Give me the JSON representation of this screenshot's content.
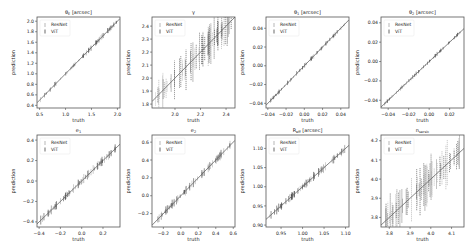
{
  "figure": {
    "legend": [
      "ResNet",
      "ViT"
    ],
    "colors": {
      "resnet": "#9a9a9a",
      "vit": "#2a2a2a",
      "diagonal": "#666666",
      "frame": "#555555"
    }
  },
  "chart_data": [
    {
      "type": "scatter",
      "title": "θE [arcsec]",
      "xlabel": "truth",
      "ylabel": "prediction",
      "xlim": [
        0.45,
        2.05
      ],
      "ylim": [
        0.35,
        2.08
      ],
      "xticks": [
        0.5,
        1.0,
        1.5,
        2.0
      ],
      "xticklabels": [
        "0.5",
        "1.0",
        "1.5",
        "2.0"
      ],
      "yticks": [
        0.4,
        0.6,
        0.8,
        1.0,
        1.2,
        1.4,
        1.6,
        1.8,
        2.0
      ],
      "yticklabels": [
        "0.4",
        "0.6",
        "0.8",
        "1.0",
        "1.2",
        "1.4",
        "1.6",
        "1.8",
        "2.0"
      ],
      "spread": 0.03,
      "legend": [
        "ResNet",
        "ViT"
      ],
      "legend_position": "upper left"
    },
    {
      "type": "scatter",
      "title": "γ",
      "xlabel": "truth",
      "ylabel": "prediction",
      "xlim": [
        1.82,
        2.47
      ],
      "ylim": [
        1.77,
        2.47
      ],
      "xticks": [
        2.0,
        2.2,
        2.4
      ],
      "xticklabels": [
        "2.0",
        "2.2",
        "2.4"
      ],
      "yticks": [
        1.8,
        1.9,
        2.0,
        2.1,
        2.2,
        2.3,
        2.4
      ],
      "yticklabels": [
        "1.8",
        "1.9",
        "2.0",
        "2.1",
        "2.2",
        "2.3",
        "2.4"
      ],
      "spread": 0.12,
      "legend": [
        "ResNet",
        "ViT"
      ],
      "legend_position": "upper left"
    },
    {
      "type": "scatter",
      "title": "θ1 [arcsec]",
      "xlabel": "truth",
      "ylabel": "prediction",
      "xlim": [
        -0.042,
        0.049
      ],
      "ylim": [
        -0.045,
        0.052
      ],
      "xticks": [
        -0.04,
        -0.02,
        0.0,
        0.02,
        0.04
      ],
      "xticklabels": [
        "−0.04",
        "−0.02",
        "0.00",
        "0.02",
        "0.04"
      ],
      "yticks": [
        -0.04,
        -0.02,
        0.0,
        0.02,
        0.04
      ],
      "yticklabels": [
        "−0.04",
        "−0.02",
        "0.00",
        "0.02",
        "0.04"
      ],
      "spread": 0.025,
      "legend": [
        "ResNet",
        "ViT"
      ],
      "legend_position": "upper left"
    },
    {
      "type": "scatter",
      "title": "θ2 [arcsec]",
      "xlabel": "truth",
      "ylabel": "prediction",
      "xlim": [
        -0.047,
        0.034
      ],
      "ylim": [
        -0.048,
        0.046
      ],
      "xticks": [
        -0.04,
        -0.02,
        0.0,
        0.02
      ],
      "xticklabels": [
        "−0.04",
        "−0.02",
        "0.00",
        "0.02"
      ],
      "yticks": [
        -0.04,
        -0.02,
        0.0,
        0.02,
        0.04
      ],
      "yticklabels": [
        "−0.04",
        "−0.02",
        "0.00",
        "0.02",
        "0.04"
      ],
      "spread": 0.022,
      "legend": [
        "ResNet",
        "ViT"
      ],
      "legend_position": "upper left"
    },
    {
      "type": "scatter",
      "title": "e1",
      "xlabel": "truth",
      "ylabel": "prediction",
      "xlim": [
        -0.42,
        0.36
      ],
      "ylim": [
        -0.45,
        0.45
      ],
      "xticks": [
        -0.4,
        -0.2,
        0.0,
        0.2
      ],
      "xticklabels": [
        "−0.4",
        "−0.2",
        "0.0",
        "0.2"
      ],
      "yticks": [
        -0.4,
        -0.2,
        0.0,
        0.2,
        0.4
      ],
      "yticklabels": [
        "−0.4",
        "−0.2",
        "0.0",
        "0.2",
        "0.4"
      ],
      "spread": 0.05,
      "legend": [
        "ResNet",
        "ViT"
      ],
      "legend_position": "upper left"
    },
    {
      "type": "scatter",
      "title": "e2",
      "xlabel": "truth",
      "ylabel": "prediction",
      "xlim": [
        -0.33,
        0.62
      ],
      "ylim": [
        -0.35,
        0.68
      ],
      "xticks": [
        -0.2,
        0.0,
        0.2,
        0.4,
        0.6
      ],
      "xticklabels": [
        "−0.2",
        "0.0",
        "0.2",
        "0.4",
        "0.6"
      ],
      "yticks": [
        -0.2,
        0.0,
        0.2,
        0.4,
        0.6
      ],
      "yticklabels": [
        "−0.2",
        "0.0",
        "0.2",
        "0.4",
        "0.6"
      ],
      "spread": 0.05,
      "legend": [
        "ResNet",
        "ViT"
      ],
      "legend_position": "upper left"
    },
    {
      "type": "scatter",
      "title": "Reff [arcsec]",
      "xlabel": "truth",
      "ylabel": "prediction",
      "xlim": [
        0.915,
        1.108
      ],
      "ylim": [
        0.895,
        1.135
      ],
      "xticks": [
        0.95,
        1.0,
        1.05,
        1.1
      ],
      "xticklabels": [
        "0.95",
        "1.00",
        "1.05",
        "1.10"
      ],
      "yticks": [
        0.9,
        0.95,
        1.0,
        1.05,
        1.1
      ],
      "yticklabels": [
        "0.90",
        "0.95",
        "1.00",
        "1.05",
        "1.10"
      ],
      "spread": 0.05,
      "legend": [
        "ResNet",
        "ViT"
      ],
      "legend_position": "upper left"
    },
    {
      "type": "scatter",
      "title": "nsersic",
      "xlabel": "truth",
      "ylabel": "prediction",
      "xlim": [
        3.76,
        4.16
      ],
      "ylim": [
        3.75,
        4.23
      ],
      "xticks": [
        3.8,
        3.9,
        4.0,
        4.1
      ],
      "xticklabels": [
        "3.8",
        "3.9",
        "4.0",
        "4.1"
      ],
      "yticks": [
        3.8,
        3.9,
        4.0,
        4.1,
        4.2
      ],
      "yticklabels": [
        "3.8",
        "3.9",
        "4.0",
        "4.1",
        "4.2"
      ],
      "spread": 0.13,
      "legend": [
        "ResNet",
        "ViT"
      ],
      "legend_position": "upper left"
    }
  ]
}
